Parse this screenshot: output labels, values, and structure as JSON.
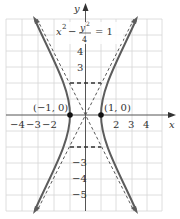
{
  "figure": {
    "equation": {
      "lhs_x": "x",
      "lhs_x_exp": "2",
      "minus": "−",
      "frac_num": "y",
      "frac_num_exp": "2",
      "frac_den": "4",
      "equals": "= 1"
    },
    "axes": {
      "x_label": "x",
      "y_label": "y",
      "x_ticks": [
        "−4",
        "−3",
        "−2",
        "2",
        "3",
        "4"
      ],
      "y_ticks": [
        "4",
        "3",
        "−3",
        "−4",
        "−5"
      ]
    },
    "points": [
      {
        "label": "(−1, 0)",
        "x": -1,
        "y": 0
      },
      {
        "label": "(1, 0)",
        "x": 1,
        "y": 0
      }
    ],
    "colors": {
      "curve": "#5a5a5a",
      "axes": "#555555",
      "grid": "#d4d4d4",
      "dashed": "#333333"
    }
  }
}
